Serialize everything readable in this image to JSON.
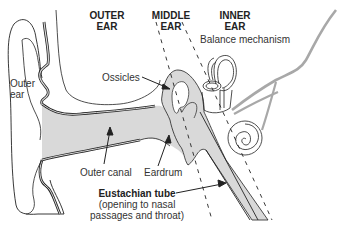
{
  "diagram": {
    "type": "anatomy",
    "regions": [
      {
        "id": "outer",
        "label_line1": "OUTER",
        "label_line2": "EAR"
      },
      {
        "id": "middle",
        "label_line1": "MIDDLE",
        "label_line2": "EAR"
      },
      {
        "id": "inner",
        "label_line1": "INNER",
        "label_line2": "EAR"
      }
    ],
    "labels": {
      "outer_ear_line1": "Outer",
      "outer_ear_line2": "ear",
      "balance": "Balance mechanism",
      "ossicles": "Ossicles",
      "outer_canal": "Outer canal",
      "eardrum": "Eardrum",
      "eustachian_title": "Eustachian tube",
      "eustachian_line2": "(opening to nasal",
      "eustachian_line3": "passages and throat)"
    },
    "colors": {
      "fill_gray": "#d9d9d9",
      "line": "#222222",
      "nerve": "#a8a8a8"
    }
  }
}
